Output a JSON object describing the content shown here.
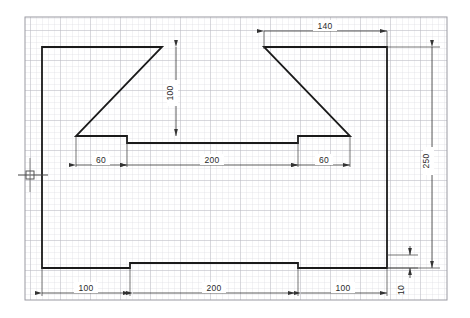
{
  "document": {
    "type": "engineering-drawing",
    "title": "Stepped profile part outline on graph paper",
    "units": "mm",
    "background_color": "#ffffff",
    "outline_color": "#1a1a1a",
    "dimension_color": "#333333",
    "grid_minor_color": "#d8d8dd",
    "grid_major_color": "#b4b4bc",
    "grid_border_color": "#9a9aa2"
  },
  "grid": {
    "x": 25,
    "y": 17,
    "width": 422,
    "height": 283,
    "minor_spacing": 6,
    "major_every": 5
  },
  "part": {
    "name": "stepped-profile-outline",
    "points": [
      [
        42,
        47
      ],
      [
        162,
        47
      ],
      [
        76,
        136
      ],
      [
        127,
        136
      ],
      [
        127,
        143
      ],
      [
        298,
        143
      ],
      [
        298,
        136
      ],
      [
        350,
        136
      ],
      [
        264,
        47
      ],
      [
        387,
        47
      ],
      [
        387,
        268
      ],
      [
        298,
        268
      ],
      [
        298,
        263
      ],
      [
        130,
        263
      ],
      [
        130,
        268
      ],
      [
        42,
        268
      ]
    ]
  },
  "center_mark": {
    "name": "center-mark",
    "x": 30,
    "y": 175
  },
  "dimensions": [
    {
      "id": "dim-140-top",
      "label": "140",
      "orientation": "horizontal",
      "value": 140,
      "text_x": 325,
      "text_y": 27,
      "line_y": 31,
      "from_x": 264,
      "to_x": 387
    },
    {
      "id": "dim-100-vertical",
      "label": "100",
      "orientation": "vertical",
      "value": 100,
      "text_x": 172,
      "text_y": 94,
      "line_x": 176,
      "from_y": 47,
      "to_y": 136
    },
    {
      "id": "dim-60-left",
      "label": "60",
      "orientation": "horizontal",
      "value": 60,
      "text_x": 100,
      "text_y": 161,
      "line_y": 165,
      "from_x": 76,
      "to_x": 127
    },
    {
      "id": "dim-200-middle",
      "label": "200",
      "orientation": "horizontal",
      "value": 200,
      "text_x": 212,
      "text_y": 161,
      "line_y": 165,
      "from_x": 127,
      "to_x": 298
    },
    {
      "id": "dim-60-right",
      "label": "60",
      "orientation": "horizontal",
      "value": 60,
      "text_x": 323,
      "text_y": 161,
      "line_y": 165,
      "from_x": 298,
      "to_x": 350
    },
    {
      "id": "dim-250-right",
      "label": "250",
      "orientation": "vertical",
      "value": 250,
      "text_x": 428,
      "text_y": 163,
      "line_x": 432,
      "from_y": 47,
      "to_y": 268
    },
    {
      "id": "dim-10-right",
      "label": "10",
      "orientation": "vertical",
      "value": 10,
      "text_x": 406,
      "text_y": 288,
      "line_x": 410,
      "from_y": 255,
      "to_y": 268
    },
    {
      "id": "dim-100-bottom-left",
      "label": "100",
      "orientation": "horizontal",
      "value": 100,
      "text_x": 86,
      "text_y": 289,
      "line_y": 293,
      "from_x": 42,
      "to_x": 130
    },
    {
      "id": "dim-200-bottom",
      "label": "200",
      "orientation": "horizontal",
      "value": 200,
      "text_x": 214,
      "text_y": 289,
      "line_y": 293,
      "from_x": 130,
      "to_x": 298
    },
    {
      "id": "dim-100-bottom-right",
      "label": "100",
      "orientation": "horizontal",
      "value": 100,
      "text_x": 343,
      "text_y": 289,
      "line_y": 293,
      "from_x": 298,
      "to_x": 387
    }
  ],
  "labels": {
    "dim_140": "140",
    "dim_100_vert": "100",
    "dim_60_left": "60",
    "dim_200_mid": "200",
    "dim_60_right": "60",
    "dim_250": "250",
    "dim_10": "10",
    "dim_100_bl": "100",
    "dim_200_bottom": "200",
    "dim_100_br": "100"
  }
}
